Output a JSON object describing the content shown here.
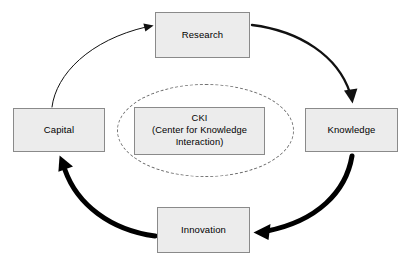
{
  "diagram": {
    "background_color": "#ffffff",
    "node_fill_color": "#ececec",
    "node_border_color": "#8a8a8a",
    "text_color": "#000000",
    "arrow_color": "#000000",
    "ellipse_style": "dashed",
    "nodes": [
      {
        "id": "research",
        "label": "Research",
        "x": 155,
        "y": 12,
        "width": 95,
        "height": 46
      },
      {
        "id": "knowledge",
        "label": "Knowledge",
        "x": 305,
        "y": 108,
        "width": 93,
        "height": 44
      },
      {
        "id": "innovation",
        "label": "Innovation",
        "x": 157,
        "y": 207,
        "width": 93,
        "height": 46
      },
      {
        "id": "capital",
        "label": "Capital",
        "x": 13,
        "y": 108,
        "width": 92,
        "height": 44
      }
    ],
    "center": {
      "id": "cki",
      "acronym": "CKI",
      "expansion_line1": "(Center for Knowledge",
      "expansion_line2": "Interaction)",
      "x": 134,
      "y": 107,
      "width": 131,
      "height": 48
    },
    "ellipse": {
      "x": 117,
      "y": 84,
      "width": 177,
      "height": 93
    },
    "arrows": [
      {
        "id": "capital-to-research",
        "from": "Capital",
        "to": "Research",
        "weight": "thin",
        "stroke_width": 1.0
      },
      {
        "id": "research-to-knowledge",
        "from": "Research",
        "to": "Knowledge",
        "weight": "medium",
        "stroke_width": 2.4
      },
      {
        "id": "knowledge-to-innovation",
        "from": "Knowledge",
        "to": "Innovation",
        "weight": "thick",
        "stroke_width": 5.0
      },
      {
        "id": "innovation-to-capital",
        "from": "Innovation",
        "to": "Capital",
        "weight": "thick",
        "stroke_width": 5.0
      }
    ]
  }
}
